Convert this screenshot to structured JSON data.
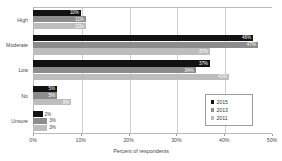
{
  "chart_data": {
    "type": "bar",
    "orientation": "horizontal",
    "title": "",
    "xlabel": "Percent of respondents",
    "ylabel": "",
    "xlim": [
      0,
      50
    ],
    "xticks": [
      "0%",
      "10%",
      "20%",
      "30%",
      "40%",
      "50%"
    ],
    "xtick_values": [
      0,
      10,
      20,
      30,
      40,
      50
    ],
    "grid": true,
    "legend_position": "center-right",
    "categories": [
      "High",
      "Moderate",
      "Low",
      "No",
      "Unsure"
    ],
    "series": [
      {
        "name": "2015",
        "color": "#121212",
        "values": [
          10,
          46,
          37,
          5,
          2
        ],
        "labels": [
          "10%",
          "46%",
          "37%",
          "5%",
          "2%"
        ]
      },
      {
        "name": "2013",
        "color": "#8c8c8c",
        "values": [
          11,
          47,
          34,
          5,
          3
        ],
        "labels": [
          "11%",
          "47%",
          "34%",
          "5%",
          "3%"
        ]
      },
      {
        "name": "2011",
        "color": "#bdbdbd",
        "values": [
          11,
          37,
          41,
          8,
          3
        ],
        "labels": [
          "11%",
          "37%",
          "41%",
          "8%",
          "3%"
        ]
      }
    ]
  }
}
